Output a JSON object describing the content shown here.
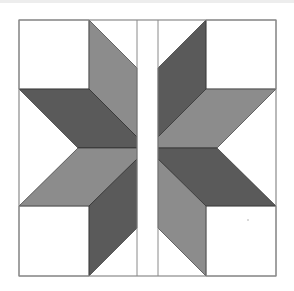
{
  "image": {
    "subject": "quilt-block-eight-point-star",
    "description": "LeMoyne-style eight-point star quilt block split by a vertical white sashing strip",
    "width": 294,
    "height": 291
  },
  "colors": {
    "background": "#ffffff",
    "top_strip": "#ededed",
    "outline": "#8a8a8a",
    "light_gray": "#8c8c8c",
    "dark_gray": "#5a5a5a",
    "edge": "#222222"
  },
  "block": {
    "left": 19,
    "top": 20,
    "right": 276,
    "bottom": 276,
    "strip_left": 137,
    "strip_right": 158,
    "center_y": 148
  },
  "pieces": [
    {
      "name": "corner-square-top-left",
      "fill": "white",
      "points": "19,20 89,20 89,89 19,89"
    },
    {
      "name": "corner-square-top-right",
      "fill": "white",
      "points": "206,20 276,20 276,89 206,89"
    },
    {
      "name": "corner-square-bottom-left",
      "fill": "white",
      "points": "19,206 89,206 89,276 19,276"
    },
    {
      "name": "corner-square-bottom-right",
      "fill": "white",
      "points": "206,206 276,206 276,276 206,276"
    },
    {
      "name": "diamond-top-left-vertical",
      "fill": "light",
      "points": "89,20 137,68 137,137 89,89"
    },
    {
      "name": "diamond-top-left-horizontal",
      "fill": "dark",
      "points": "19,89 89,89 137,137 137,148 78,148"
    },
    {
      "name": "diamond-bottom-left-horizontal",
      "fill": "light",
      "points": "78,148 137,148 137,159 89,206 19,206"
    },
    {
      "name": "diamond-bottom-left-vertical",
      "fill": "dark",
      "points": "89,206 137,159 137,228 89,276"
    },
    {
      "name": "diamond-top-right-vertical",
      "fill": "dark",
      "points": "206,20 158,68 158,137 206,89"
    },
    {
      "name": "diamond-top-right-horizontal",
      "fill": "light",
      "points": "276,89 206,89 158,137 158,148 217,148"
    },
    {
      "name": "diamond-bottom-right-horizontal",
      "fill": "dark",
      "points": "217,148 158,148 158,159 206,206 276,206"
    },
    {
      "name": "diamond-bottom-right-vertical",
      "fill": "light",
      "points": "206,206 158,159 158,228 206,276"
    }
  ]
}
